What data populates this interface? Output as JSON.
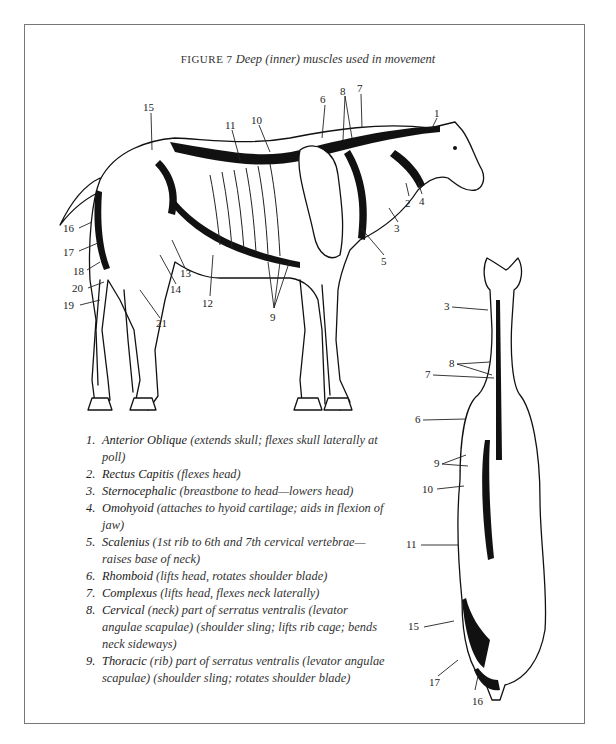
{
  "figure": {
    "label": "FIGURE 7",
    "title": "Deep (inner) muscles used in movement"
  },
  "side_view_labels": [
    {
      "n": "1",
      "x": 434,
      "y": 108
    },
    {
      "n": "2",
      "x": 407,
      "y": 198
    },
    {
      "n": "3",
      "x": 396,
      "y": 225
    },
    {
      "n": "4",
      "x": 420,
      "y": 196
    },
    {
      "n": "5",
      "x": 383,
      "y": 258
    },
    {
      "n": "6",
      "x": 322,
      "y": 95
    },
    {
      "n": "7",
      "x": 358,
      "y": 84
    },
    {
      "n": "8",
      "x": 341,
      "y": 86
    },
    {
      "n": "9",
      "x": 271,
      "y": 316
    },
    {
      "n": "10",
      "x": 255,
      "y": 115
    },
    {
      "n": "11",
      "x": 228,
      "y": 120
    },
    {
      "n": "12",
      "x": 203,
      "y": 302
    },
    {
      "n": "13",
      "x": 181,
      "y": 272
    },
    {
      "n": "14",
      "x": 172,
      "y": 288
    },
    {
      "n": "15",
      "x": 143,
      "y": 103
    },
    {
      "n": "16",
      "x": 64,
      "y": 225
    },
    {
      "n": "17",
      "x": 64,
      "y": 248
    },
    {
      "n": "18",
      "x": 74,
      "y": 267
    },
    {
      "n": "19",
      "x": 65,
      "y": 303
    },
    {
      "n": "20",
      "x": 73,
      "y": 285
    },
    {
      "n": "21",
      "x": 157,
      "y": 322
    }
  ],
  "rear_view_labels": [
    {
      "n": "3",
      "x": 444,
      "y": 303
    },
    {
      "n": "8",
      "x": 448,
      "y": 364
    },
    {
      "n": "7",
      "x": 425,
      "y": 372
    },
    {
      "n": "6",
      "x": 415,
      "y": 417
    },
    {
      "n": "9",
      "x": 434,
      "y": 461
    },
    {
      "n": "10",
      "x": 423,
      "y": 486
    },
    {
      "n": "11",
      "x": 406,
      "y": 541
    },
    {
      "n": "15",
      "x": 409,
      "y": 625
    },
    {
      "n": "17",
      "x": 429,
      "y": 679
    },
    {
      "n": "16",
      "x": 472,
      "y": 697
    }
  ],
  "legend": [
    {
      "num": "1.",
      "name": "Anterior Oblique",
      "desc": "(extends skull; flexes skull laterally at poll)"
    },
    {
      "num": "2.",
      "name": "Rectus Capitis",
      "desc": "(flexes head)"
    },
    {
      "num": "3.",
      "name": "Sternocephalic",
      "desc": "(breastbone to head—lowers head)"
    },
    {
      "num": "4.",
      "name": "Omohyoid",
      "desc": "(attaches to hyoid cartilage; aids in flexion of jaw)"
    },
    {
      "num": "5.",
      "name": "Scalenius",
      "desc": "(1st rib to 6th and 7th cervical vertebrae—raises base of neck)"
    },
    {
      "num": "6.",
      "name": "Rhomboid",
      "desc": "(lifts head, rotates shoulder blade)"
    },
    {
      "num": "7.",
      "name": "Complexus",
      "desc": "(lifts head, flexes neck laterally)"
    },
    {
      "num": "8.",
      "name": "Cervical",
      "desc": "(neck) part of serratus ventralis (levator angulae scapulae) (shoulder sling; lifts rib cage; bends neck sideways)"
    },
    {
      "num": "9.",
      "name": "Thoracic",
      "desc": "(rib) part of serratus ventralis (levator angulae scapulae) (shoulder sling; rotates shoulder blade)"
    }
  ]
}
